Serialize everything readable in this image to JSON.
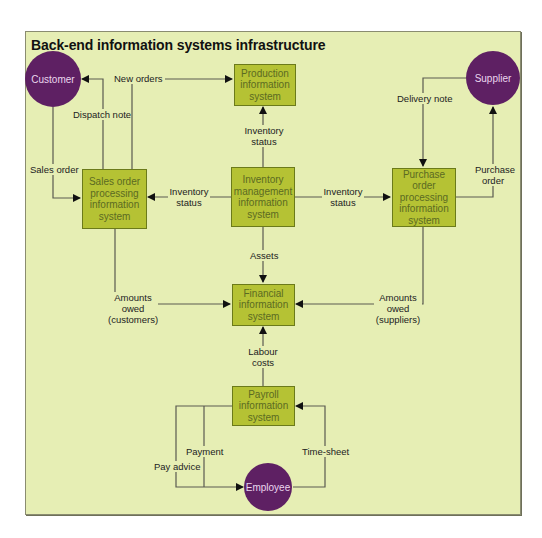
{
  "title": "Back-end information systems infrastructure",
  "colors": {
    "background": "#e6eeb4",
    "system_box": "#b5c234",
    "entity_circle": "#5e2063",
    "line": "#555555"
  },
  "entities": {
    "customer": "Customer",
    "supplier": "Supplier",
    "employee": "Employee"
  },
  "systems": {
    "production": "Production information system",
    "sales_order": "Sales order processing information system",
    "inventory": "Inventory management information system",
    "purchase_order": "Purchase order processing information system",
    "financial": "Financial information system",
    "payroll": "Payroll information system"
  },
  "flows": {
    "new_orders": "New orders",
    "dispatch_note": "Dispatch note",
    "sales_order": "Sales order",
    "inventory_status_production": "Inventory status",
    "inventory_status_sales": "Inventory status",
    "inventory_status_purchase": "Inventory status",
    "delivery_note": "Delivery note",
    "purchase_order": "Purchase order",
    "assets": "Assets",
    "amounts_owed_customers": "Amounts owed (customers)",
    "amounts_owed_suppliers": "Amounts owed (suppliers)",
    "labour_costs": "Labour costs",
    "payment": "Payment",
    "pay_advice": "Pay advice",
    "time_sheet": "Time-sheet"
  }
}
